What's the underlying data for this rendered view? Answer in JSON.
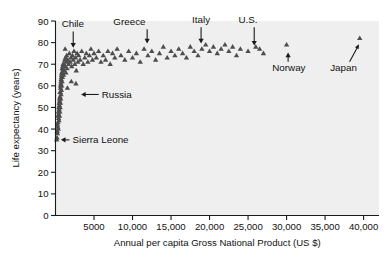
{
  "chart_data": {
    "type": "scatter",
    "title": "",
    "xlabel": "Annual per capita Gross National Product (US $)",
    "ylabel": "Life expectancy (years)",
    "xlim": [
      0,
      42000
    ],
    "ylim": [
      0,
      90
    ],
    "grid": false,
    "legend": null,
    "xticks": [
      5000,
      10000,
      15000,
      20000,
      25000,
      30000,
      35000,
      40000
    ],
    "xticklabels": [
      "5000",
      "10,000",
      "15,000",
      "20,000",
      "25,000",
      "30,000",
      "35,000",
      "40,000"
    ],
    "yticks": [
      0,
      10,
      20,
      30,
      40,
      50,
      60,
      70,
      80,
      90
    ],
    "yticklabels": [
      "0",
      "10",
      "20",
      "30",
      "40",
      "50",
      "60",
      "70",
      "80",
      "90"
    ],
    "marker": "triangle",
    "marker_color": "#4d4d4d",
    "plot_background": "#efefef",
    "points": [
      [
        250,
        38
      ],
      [
        300,
        41
      ],
      [
        320,
        43
      ],
      [
        360,
        40
      ],
      [
        400,
        45
      ],
      [
        420,
        47
      ],
      [
        450,
        44
      ],
      [
        470,
        49
      ],
      [
        500,
        51
      ],
      [
        520,
        46
      ],
      [
        540,
        53
      ],
      [
        560,
        48
      ],
      [
        580,
        55
      ],
      [
        600,
        50
      ],
      [
        620,
        57
      ],
      [
        640,
        52
      ],
      [
        660,
        59
      ],
      [
        680,
        54
      ],
      [
        700,
        61
      ],
      [
        720,
        56
      ],
      [
        740,
        63
      ],
      [
        760,
        58
      ],
      [
        780,
        65
      ],
      [
        800,
        60
      ],
      [
        830,
        66
      ],
      [
        850,
        62
      ],
      [
        880,
        68
      ],
      [
        900,
        64
      ],
      [
        930,
        69
      ],
      [
        960,
        67
      ],
      [
        200,
        36
      ],
      [
        230,
        39
      ],
      [
        270,
        42
      ],
      [
        340,
        46
      ],
      [
        380,
        48
      ],
      [
        430,
        50
      ],
      [
        480,
        52
      ],
      [
        530,
        54
      ],
      [
        590,
        57
      ],
      [
        650,
        60
      ],
      [
        710,
        62
      ],
      [
        770,
        64
      ],
      [
        840,
        66
      ],
      [
        910,
        68
      ],
      [
        980,
        70
      ],
      [
        1050,
        65
      ],
      [
        1100,
        70
      ],
      [
        1150,
        67
      ],
      [
        1200,
        72
      ],
      [
        1250,
        69
      ],
      [
        1300,
        73
      ],
      [
        1350,
        66
      ],
      [
        1400,
        71
      ],
      [
        1450,
        74
      ],
      [
        1500,
        68
      ],
      [
        1600,
        72
      ],
      [
        1700,
        70
      ],
      [
        1800,
        75
      ],
      [
        1900,
        71
      ],
      [
        2000,
        73
      ],
      [
        2100,
        69
      ],
      [
        2200,
        74
      ],
      [
        2300,
        72
      ],
      [
        2400,
        76
      ],
      [
        2500,
        70
      ],
      [
        2600,
        73
      ],
      [
        2700,
        67
      ],
      [
        2800,
        75
      ],
      [
        2900,
        71
      ],
      [
        3000,
        74
      ],
      [
        3200,
        72
      ],
      [
        3400,
        76
      ],
      [
        3600,
        70
      ],
      [
        3800,
        73
      ],
      [
        4000,
        75
      ],
      [
        4200,
        71
      ],
      [
        4400,
        74
      ],
      [
        4600,
        77
      ],
      [
        4800,
        72
      ],
      [
        5000,
        75
      ],
      [
        5300,
        73
      ],
      [
        5600,
        76
      ],
      [
        5900,
        71
      ],
      [
        6200,
        74
      ],
      [
        6500,
        72
      ],
      [
        6800,
        76
      ],
      [
        7100,
        70
      ],
      [
        7400,
        75
      ],
      [
        7700,
        73
      ],
      [
        8000,
        77
      ],
      [
        8500,
        74
      ],
      [
        9000,
        72
      ],
      [
        9500,
        76
      ],
      [
        10000,
        73
      ],
      [
        10500,
        75
      ],
      [
        11000,
        71
      ],
      [
        11500,
        77
      ],
      [
        12000,
        74
      ],
      [
        12500,
        76
      ],
      [
        13000,
        72
      ],
      [
        13500,
        75
      ],
      [
        14000,
        78
      ],
      [
        14500,
        73
      ],
      [
        15000,
        76
      ],
      [
        15500,
        74
      ],
      [
        16000,
        77
      ],
      [
        16500,
        75
      ],
      [
        17000,
        73
      ],
      [
        17500,
        78
      ],
      [
        18000,
        76
      ],
      [
        18500,
        74
      ],
      [
        19000,
        77
      ],
      [
        19500,
        79
      ],
      [
        20000,
        76
      ],
      [
        20500,
        78
      ],
      [
        21000,
        75
      ],
      [
        21500,
        77
      ],
      [
        22000,
        79
      ],
      [
        22500,
        76
      ],
      [
        23000,
        78
      ],
      [
        23500,
        74
      ],
      [
        24000,
        77
      ],
      [
        25000,
        76
      ],
      [
        26000,
        78
      ],
      [
        1250,
        77
      ],
      [
        1550,
        59
      ],
      [
        2050,
        62
      ],
      [
        2650,
        61
      ],
      [
        150,
        35
      ],
      [
        26500,
        77
      ],
      [
        27000,
        75
      ],
      [
        30000,
        79
      ],
      [
        39500,
        82
      ]
    ],
    "annotations": [
      {
        "label": "Chile",
        "label_x": 2250,
        "label_y": 87,
        "point_x": 2300,
        "point_y": 76
      },
      {
        "label": "Greece",
        "label_x": 9600,
        "label_y": 88,
        "point_x": 11900,
        "point_y": 78
      },
      {
        "label": "Italy",
        "label_x": 18900,
        "label_y": 89,
        "point_x": 18900,
        "point_y": 78
      },
      {
        "label": "U.S.",
        "label_x": 25000,
        "label_y": 89,
        "point_x": 25800,
        "point_y": 77
      },
      {
        "label": "Norway",
        "label_x": 30300,
        "label_y": 67,
        "point_x": 30200,
        "point_y": 78
      },
      {
        "label": "Russia",
        "label_x": 6000,
        "label_y": 56,
        "point_x": 2800,
        "point_y": 56
      },
      {
        "label": "Sierra Leone",
        "label_x": 2200,
        "label_y": 35,
        "point_x": 180,
        "point_y": 35
      },
      {
        "label": "Japan",
        "label_x": 37400,
        "label_y": 67,
        "point_x": 39600,
        "point_y": 82
      }
    ]
  }
}
